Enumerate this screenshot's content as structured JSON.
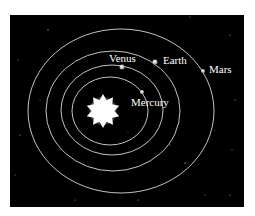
{
  "diagram": {
    "background": "#000000",
    "orbit_color": "#d8d8d8",
    "sun": {
      "name": "Sun",
      "cx": 103,
      "cy": 111,
      "color": "#ffffff"
    },
    "planets": [
      {
        "name": "Mercury",
        "label": "Mercury",
        "cx": 142,
        "cy": 92,
        "r": 2,
        "label_x": 131,
        "label_y": 105
      },
      {
        "name": "Venus",
        "label": "Venus",
        "cx": 122,
        "cy": 67,
        "r": 2.5,
        "label_x": 109,
        "label_y": 62
      },
      {
        "name": "Earth",
        "label": "Earth",
        "cx": 155,
        "cy": 62,
        "r": 2.5,
        "label_x": 163,
        "label_y": 64
      },
      {
        "name": "Mars",
        "label": "Mars",
        "cx": 203,
        "cy": 71,
        "r": 2,
        "label_x": 209,
        "label_y": 71
      }
    ],
    "orbits": [
      {
        "name": "Mercury",
        "cx": 110,
        "cy": 111,
        "rx": 38,
        "ry": 34
      },
      {
        "name": "Venus",
        "cx": 112,
        "cy": 110,
        "rx": 51,
        "ry": 45
      },
      {
        "name": "Earth",
        "cx": 113,
        "cy": 111,
        "rx": 67,
        "ry": 60
      },
      {
        "name": "Mars",
        "cx": 121,
        "cy": 111,
        "rx": 93,
        "ry": 82
      }
    ]
  }
}
